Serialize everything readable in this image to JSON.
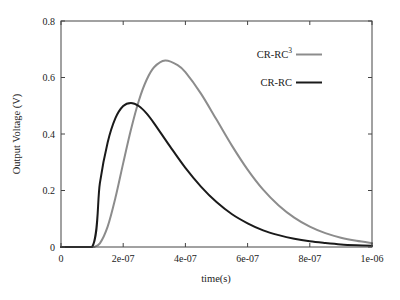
{
  "chart_data": {
    "type": "line",
    "title": "",
    "xlabel": "time(s)",
    "ylabel": "Output Voltage (V)",
    "xlim": [
      0,
      1e-06
    ],
    "ylim": [
      0,
      0.8
    ],
    "grid": false,
    "legend_position": "upper right (inside)",
    "x_ticks": [
      {
        "value": 0,
        "label": "0"
      },
      {
        "value": 2e-07,
        "label": "2e-07"
      },
      {
        "value": 4e-07,
        "label": "4e-07"
      },
      {
        "value": 6e-07,
        "label": "6e-07"
      },
      {
        "value": 8e-07,
        "label": "8e-07"
      },
      {
        "value": 1e-06,
        "label": "1e-06"
      }
    ],
    "y_ticks": [
      {
        "value": 0,
        "label": "0"
      },
      {
        "value": 0.2,
        "label": "0.2"
      },
      {
        "value": 0.4,
        "label": "0.4"
      },
      {
        "value": 0.6,
        "label": "0.6"
      },
      {
        "value": 0.8,
        "label": "0.8"
      }
    ],
    "series": [
      {
        "name": "CR-RC^3",
        "label_main": "CR-RC",
        "label_sup": "3",
        "color": "#8c8c8c",
        "peak": {
          "x": 3.35e-07,
          "y": 0.66
        },
        "x": [
          0,
          1e-07,
          1.05e-07,
          1.25e-07,
          1.5e-07,
          1.75e-07,
          2e-07,
          2.25e-07,
          2.5e-07,
          2.75e-07,
          3e-07,
          3.35e-07,
          3.75e-07,
          4e-07,
          4.5e-07,
          5e-07,
          5.5e-07,
          6e-07,
          6.5e-07,
          7e-07,
          7.5e-07,
          8e-07,
          8.5e-07,
          9e-07,
          9.5e-07,
          1e-06
        ],
        "values": [
          0,
          0,
          0,
          0.013,
          0.072,
          0.174,
          0.297,
          0.416,
          0.517,
          0.591,
          0.637,
          0.66,
          0.644,
          0.619,
          0.543,
          0.451,
          0.358,
          0.274,
          0.203,
          0.147,
          0.104,
          0.072,
          0.049,
          0.033,
          0.022,
          0.014
        ]
      },
      {
        "name": "CR-RC",
        "label_main": "CR-RC",
        "label_sup": "",
        "color": "#1a1a1a",
        "peak": {
          "x": 2.25e-07,
          "y": 0.51
        },
        "x": [
          0,
          1e-07,
          1.25e-07,
          1.5e-07,
          1.75e-07,
          2e-07,
          2.25e-07,
          2.5e-07,
          2.75e-07,
          3e-07,
          3.5e-07,
          4e-07,
          4.5e-07,
          5e-07,
          5.5e-07,
          6e-07,
          6.5e-07,
          7e-07,
          7.5e-07,
          8e-07,
          8.5e-07,
          9e-07,
          9.5e-07,
          1e-06
        ],
        "values": [
          0,
          0,
          0.226,
          0.37,
          0.456,
          0.499,
          0.51,
          0.499,
          0.473,
          0.437,
          0.357,
          0.28,
          0.214,
          0.159,
          0.116,
          0.084,
          0.059,
          0.042,
          0.029,
          0.02,
          0.014,
          0.009,
          0.006,
          0.004
        ]
      }
    ]
  }
}
